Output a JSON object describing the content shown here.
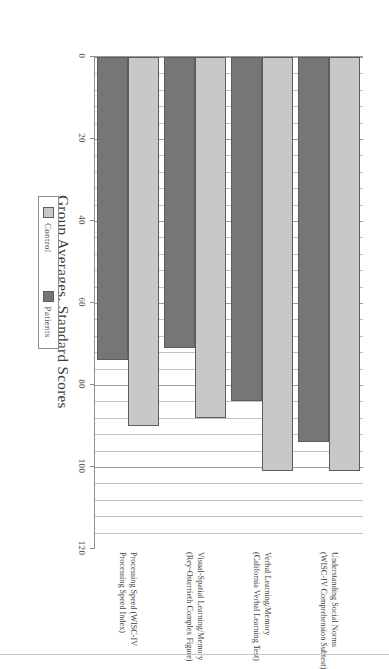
{
  "chart_data": {
    "type": "bar",
    "orientation": "horizontal",
    "title": "",
    "xlabel": "Group Averages, Standard Scores",
    "ylabel": "",
    "xlim": [
      0,
      120
    ],
    "xticks": [
      0,
      20,
      40,
      60,
      80,
      100,
      120
    ],
    "xtick_labels": [
      "0",
      "20",
      "40",
      "60",
      "80",
      "100",
      "120"
    ],
    "grid": true,
    "grid_axis": "x",
    "legend_position": "bottom-center",
    "categories": [
      "Understanding Social Norms\n(WISC-IV Comprehension Subtest)",
      "Verbal Learning/Memory\n(California Verbal Learning Test)",
      "Visual-Spatial Learning/Memory\n(Rey-Osterrieth Complex Figure)",
      "Processing Speed (WISC-IV\nProcessing Speed Index)"
    ],
    "series": [
      {
        "name": "Control",
        "color": "#c8c8c8",
        "values": [
          101,
          101,
          88,
          90
        ]
      },
      {
        "name": "Patients",
        "color": "#767676",
        "values": [
          94,
          84,
          71,
          74
        ]
      }
    ]
  },
  "axis": {
    "value_title": "Group Averages, Standard Scores",
    "ticks": [
      {
        "label": "0",
        "value": 0
      },
      {
        "label": "20",
        "value": 20
      },
      {
        "label": "40",
        "value": 40
      },
      {
        "label": "60",
        "value": 60
      },
      {
        "label": "80",
        "value": 80
      },
      {
        "label": "100",
        "value": 100
      },
      {
        "label": "120",
        "value": 120
      }
    ]
  },
  "categories": [
    {
      "line1": "Understanding Social Norms",
      "line2": "(WISC-IV Comprehension Subtest)"
    },
    {
      "line1": "Verbal Learning/Memory",
      "line2": "(California Verbal Learning Test)"
    },
    {
      "line1": "Visual-Spatial Learning/Memory",
      "line2": "(Rey-Osterrieth Complex Figure)"
    },
    {
      "line1": "Processing Speed (WISC-IV",
      "line2": "Processing Speed Index)"
    }
  ],
  "legend": {
    "items": [
      {
        "label": "Control",
        "color": "#c8c8c8"
      },
      {
        "label": "Patients",
        "color": "#767676"
      }
    ]
  },
  "colors": {
    "control": "#c8c8c8",
    "patients": "#767676",
    "gridline": "#b4b4b4",
    "axis": "#8d8d8d",
    "bar_border": "#5d5d5d"
  }
}
